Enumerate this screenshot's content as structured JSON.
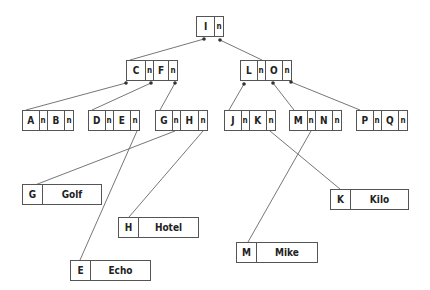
{
  "diagram": {
    "type": "B-tree",
    "root": {
      "keys": [
        "I"
      ],
      "pointer_label": "n"
    },
    "level1": [
      {
        "id": "CF",
        "keys": [
          "C",
          "F"
        ]
      },
      {
        "id": "LO",
        "keys": [
          "L",
          "O"
        ]
      }
    ],
    "level2": [
      {
        "id": "AB",
        "keys": [
          "A",
          "B"
        ]
      },
      {
        "id": "DE",
        "keys": [
          "D",
          "E"
        ]
      },
      {
        "id": "GH",
        "keys": [
          "G",
          "H"
        ]
      },
      {
        "id": "JK",
        "keys": [
          "J",
          "K"
        ]
      },
      {
        "id": "MN",
        "keys": [
          "M",
          "N"
        ]
      },
      {
        "id": "PQ",
        "keys": [
          "P",
          "Q"
        ]
      }
    ],
    "records": [
      {
        "key": "G",
        "value": "Golf"
      },
      {
        "key": "H",
        "value": "Hotel"
      },
      {
        "key": "K",
        "value": "Kilo"
      },
      {
        "key": "M",
        "value": "Mike"
      },
      {
        "key": "E",
        "value": "Echo"
      }
    ]
  }
}
